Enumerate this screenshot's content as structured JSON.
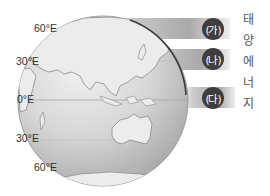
{
  "figure": {
    "latitude_labels": [
      {
        "text": "60°E",
        "position": "top"
      },
      {
        "text": "30°E",
        "position": "upper"
      },
      {
        "text": "0°E",
        "position": "equator"
      },
      {
        "text": "30°E",
        "position": "lower"
      },
      {
        "text": "60°E",
        "position": "bottom"
      }
    ],
    "bands": [
      {
        "label": "(가)"
      },
      {
        "label": "(나)"
      },
      {
        "label": "(다)"
      }
    ],
    "side_caption_chars": [
      "태",
      "양",
      "에",
      "너",
      "지"
    ],
    "side_caption": "태양에너지"
  },
  "colors": {
    "globe_fill": "#cfcfcf",
    "land_fill": "#ececec",
    "coastline": "#8a8a8a",
    "terminator": "#3a3a3a",
    "badge_fill": "#3e3e3e",
    "band_gray": "#a9a9a9"
  }
}
